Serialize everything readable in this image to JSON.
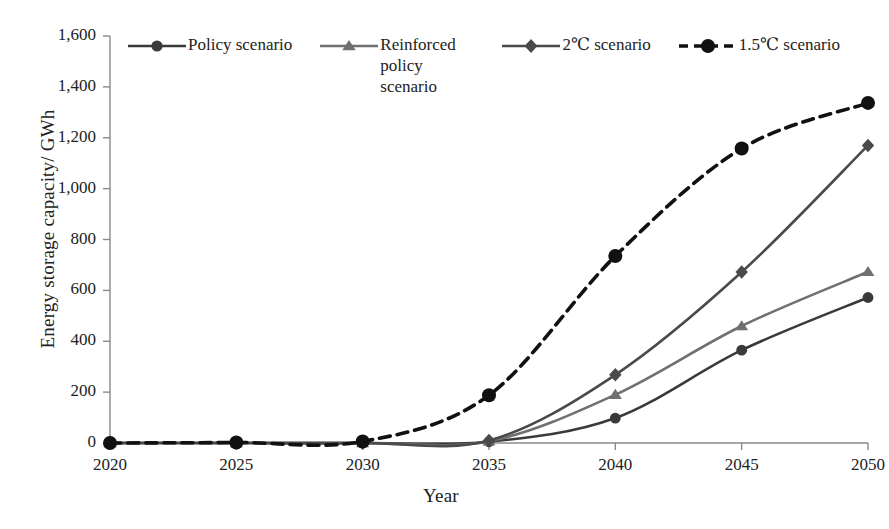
{
  "chart_data": {
    "type": "line",
    "title": "",
    "xlabel": "Year",
    "ylabel": "Energy storage capacity/ GWh",
    "x": [
      2020,
      2025,
      2030,
      2035,
      2040,
      2045,
      2050
    ],
    "categories": [
      "2020",
      "2025",
      "2030",
      "2035",
      "2040",
      "2045",
      "2050"
    ],
    "xlim": [
      2020,
      2050
    ],
    "ylim": [
      0,
      1600
    ],
    "yticks": [
      0,
      200,
      400,
      600,
      800,
      1000,
      1200,
      1400,
      1600
    ],
    "ytick_labels": [
      "0",
      "200",
      "400",
      "600",
      "800",
      "1,000",
      "1,200",
      "1,400",
      "1,600"
    ],
    "xticks": [
      2020,
      2025,
      2030,
      2035,
      2040,
      2045,
      2050
    ],
    "xtick_labels": [
      "2020",
      "2025",
      "2030",
      "2035",
      "2040",
      "2045",
      "2050"
    ],
    "grid": false,
    "legend_position": "top",
    "series": [
      {
        "name": "Policy scenario",
        "marker": "circle",
        "linestyle": "solid",
        "color": "#3a3a3a",
        "values": [
          0,
          0,
          0,
          5,
          98,
          365,
          572
        ]
      },
      {
        "name": "Reinforced policy scenario",
        "marker": "triangle",
        "linestyle": "solid",
        "color": "#707070",
        "values": [
          0,
          0,
          0,
          7,
          190,
          460,
          673
        ]
      },
      {
        "name": "2℃ scenario",
        "marker": "diamond",
        "linestyle": "solid",
        "color": "#4a4a4a",
        "values": [
          0,
          0,
          0,
          10,
          268,
          672,
          1170
        ]
      },
      {
        "name": "1.5℃ scenario",
        "marker": "circle",
        "linestyle": "dashed",
        "color": "#111111",
        "values": [
          0,
          2,
          6,
          188,
          735,
          1158,
          1337
        ]
      }
    ]
  },
  "legend": {
    "entries": [
      {
        "label": "Policy scenario"
      },
      {
        "label": "Reinforced policy scenario"
      },
      {
        "label": "2℃ scenario"
      },
      {
        "label": "1.5℃ scenario"
      }
    ]
  },
  "axes": {
    "y_title": "Energy storage capacity/ GWh",
    "x_title": "Year"
  }
}
